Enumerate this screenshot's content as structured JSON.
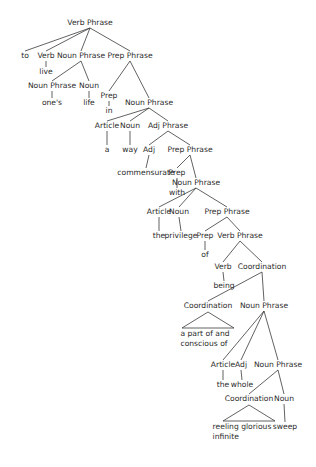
{
  "diagram": {
    "type": "syntax-tree",
    "line_color": "#3a3a3a",
    "text_color": "#2b2b2b",
    "nodes": [
      {
        "id": "vp0",
        "label": "Verb Phrase",
        "x": 90,
        "y": 23
      },
      {
        "id": "to",
        "label": "to",
        "x": 25,
        "y": 56,
        "parent": "vp0",
        "leaf": true
      },
      {
        "id": "verb1",
        "label": "Verb",
        "x": 46,
        "y": 56,
        "parent": "vp0"
      },
      {
        "id": "live",
        "label": "live",
        "x": 46,
        "y": 72,
        "parent": "verb1",
        "leaf": true
      },
      {
        "id": "np1",
        "label": "Noun Phrase",
        "x": 81,
        "y": 56,
        "parent": "vp0"
      },
      {
        "id": "np2",
        "label": "Noun Phrase",
        "x": 52,
        "y": 86,
        "parent": "np1"
      },
      {
        "id": "ones",
        "label": "one's",
        "x": 52,
        "y": 103,
        "parent": "np2",
        "leaf": true
      },
      {
        "id": "noun1",
        "label": "Noun",
        "x": 89,
        "y": 86,
        "parent": "np1"
      },
      {
        "id": "life",
        "label": "life",
        "x": 89,
        "y": 103,
        "parent": "noun1",
        "leaf": true
      },
      {
        "id": "pp1",
        "label": "Prep Phrase",
        "x": 130,
        "y": 56,
        "parent": "vp0"
      },
      {
        "id": "prep1",
        "label": "Prep",
        "x": 109,
        "y": 96,
        "parent": "pp1"
      },
      {
        "id": "in",
        "label": "in",
        "x": 109,
        "y": 111,
        "parent": "prep1",
        "leaf": true
      },
      {
        "id": "np3",
        "label": "Noun Phrase",
        "x": 149,
        "y": 103,
        "parent": "pp1"
      },
      {
        "id": "art1",
        "label": "Article",
        "x": 107,
        "y": 126,
        "parent": "np3"
      },
      {
        "id": "a",
        "label": "a",
        "x": 107,
        "y": 150,
        "parent": "art1",
        "leaf": true
      },
      {
        "id": "noun2",
        "label": "Noun",
        "x": 130,
        "y": 126,
        "parent": "np3"
      },
      {
        "id": "way",
        "label": "way",
        "x": 130,
        "y": 150,
        "parent": "noun2",
        "leaf": true
      },
      {
        "id": "adjp",
        "label": "Adj Phrase",
        "x": 168,
        "y": 126,
        "parent": "np3"
      },
      {
        "id": "adj1",
        "label": "Adj",
        "x": 149,
        "y": 150,
        "parent": "adjp"
      },
      {
        "id": "commensurate",
        "label": "commensurate",
        "x": 146,
        "y": 173,
        "parent": "adj1",
        "leaf": true
      },
      {
        "id": "pp2",
        "label": "Prep Phrase",
        "x": 190,
        "y": 150,
        "parent": "adjp"
      },
      {
        "id": "prep2",
        "label": "Prep",
        "x": 177,
        "y": 173,
        "parent": "pp2"
      },
      {
        "id": "with",
        "label": "with",
        "x": 177,
        "y": 193,
        "parent": "prep2",
        "leaf": true
      },
      {
        "id": "np4",
        "label": "Noun Phrase",
        "x": 196,
        "y": 183,
        "parent": "pp2"
      },
      {
        "id": "art2",
        "label": "Article",
        "x": 159,
        "y": 212,
        "parent": "np4"
      },
      {
        "id": "the1",
        "label": "the",
        "x": 159,
        "y": 236,
        "parent": "art2",
        "leaf": true
      },
      {
        "id": "noun3",
        "label": "Noun",
        "x": 179,
        "y": 212,
        "parent": "np4"
      },
      {
        "id": "privilege",
        "label": "privilege",
        "x": 181,
        "y": 236,
        "parent": "noun3",
        "leaf": true
      },
      {
        "id": "pp3",
        "label": "Prep Phrase",
        "x": 227,
        "y": 212,
        "parent": "np4"
      },
      {
        "id": "prep3",
        "label": "Prep",
        "x": 205,
        "y": 236,
        "parent": "pp3"
      },
      {
        "id": "of",
        "label": "of",
        "x": 205,
        "y": 255,
        "parent": "prep3",
        "leaf": true
      },
      {
        "id": "vp1",
        "label": "Verb Phrase",
        "x": 240,
        "y": 236,
        "parent": "pp3"
      },
      {
        "id": "verb2",
        "label": "Verb",
        "x": 223,
        "y": 267,
        "parent": "vp1"
      },
      {
        "id": "being",
        "label": "being",
        "x": 224,
        "y": 286,
        "parent": "verb2",
        "leaf": true
      },
      {
        "id": "coord1",
        "label": "Coordination",
        "x": 262,
        "y": 267,
        "parent": "vp1"
      },
      {
        "id": "coord2",
        "label": "Coordination",
        "x": 208,
        "y": 306,
        "parent": "coord1",
        "triangle": true
      },
      {
        "id": "apart",
        "label": "a part of and",
        "label2": "conscious of",
        "x": 205,
        "y": 334,
        "parent": "coord2",
        "leaf": true
      },
      {
        "id": "np5",
        "label": "Noun Phrase",
        "x": 264,
        "y": 306,
        "parent": "coord1"
      },
      {
        "id": "art3",
        "label": "Article",
        "x": 223,
        "y": 365,
        "parent": "np5"
      },
      {
        "id": "the2",
        "label": "the",
        "x": 223,
        "y": 385,
        "parent": "art3",
        "leaf": true
      },
      {
        "id": "adj2",
        "label": "Adj",
        "x": 241,
        "y": 365,
        "parent": "np5"
      },
      {
        "id": "whole",
        "label": "whole",
        "x": 242,
        "y": 385,
        "parent": "adj2",
        "leaf": true
      },
      {
        "id": "np6",
        "label": "Noun Phrase",
        "x": 278,
        "y": 365,
        "parent": "np5"
      },
      {
        "id": "coord3",
        "label": "Coordination",
        "x": 249,
        "y": 399,
        "parent": "np6",
        "triangle": true
      },
      {
        "id": "reeling",
        "label": "reeling glorious",
        "label2": "infinite",
        "x": 242,
        "y": 427,
        "parent": "coord3",
        "leaf": true
      },
      {
        "id": "noun4",
        "label": "Noun",
        "x": 284,
        "y": 399,
        "parent": "np6"
      },
      {
        "id": "sweep",
        "label": "sweep",
        "x": 285,
        "y": 427,
        "parent": "noun4",
        "leaf": true
      }
    ]
  }
}
